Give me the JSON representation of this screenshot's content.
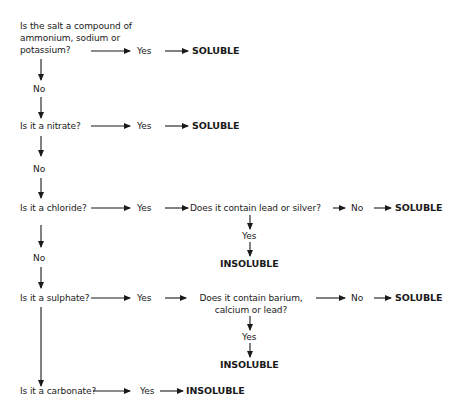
{
  "questions": {
    "q1": [
      "Is the salt a compound of",
      "ammonium, sodium or",
      "potassium?"
    ],
    "q2": "Is it a nitrate?",
    "q3": "Is it a chloride?",
    "q4": "Is it a sulphate?",
    "q5": "Is it a carbonate?"
  },
  "sub_questions": {
    "chloride": "Does it contain lead or silver?",
    "sulphate": [
      "Does it contain barium,",
      "calcium or lead?"
    ]
  },
  "labels": {
    "yes": "Yes",
    "no": "No",
    "soluble": "SOLUBLE",
    "insoluble": "INSOLUBLE"
  }
}
